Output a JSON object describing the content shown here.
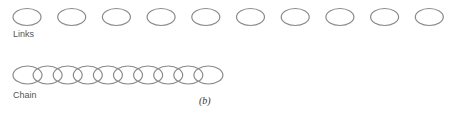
{
  "figure": {
    "caption": "(b)",
    "stroke_color": "#8a8a8a",
    "links": {
      "label": "Links",
      "count": 10,
      "cx_start": 27,
      "spacing": 44.7,
      "cy": 17,
      "rx": 14,
      "ry": 8.5
    },
    "chain": {
      "label": "Chain",
      "count": 10,
      "cx_start": 27.5,
      "spacing": 20.1,
      "cy": 75,
      "rx": 14.5,
      "ry": 9
    }
  }
}
